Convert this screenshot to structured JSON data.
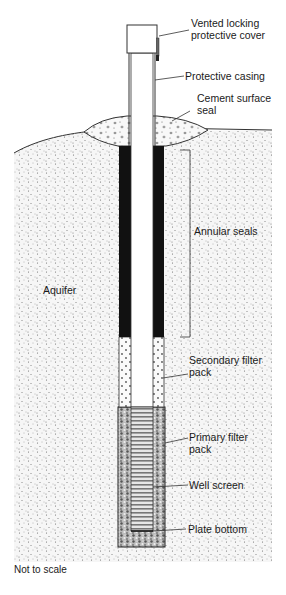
{
  "diagram": {
    "labels": {
      "cover_line1": "Vented locking",
      "cover_line2": "protective cover",
      "casing": "Protective casing",
      "cement_line1": "Cement surface",
      "cement_line2": "seal",
      "annular": "Annular seals",
      "aquifer": "Aquifer",
      "secondary_line1": "Secondary filter",
      "secondary_line2": "pack",
      "primary_line1": "Primary  filter",
      "primary_line2": "pack",
      "screen": "Well screen",
      "plate": "Plate bottom",
      "note": "Not to scale"
    },
    "colors": {
      "seal": "#111111",
      "aquifer_fill": "#f4f4f4",
      "stipple": "#555555",
      "line": "#333333"
    }
  }
}
